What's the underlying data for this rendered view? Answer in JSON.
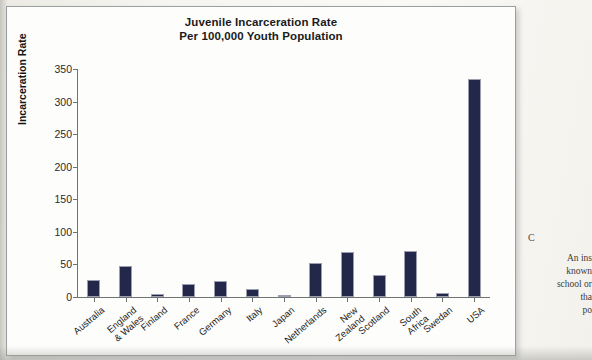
{
  "chart_data": {
    "type": "bar",
    "title": "Juvenile Incarceration Rate Per 100,000 Youth Population",
    "title_line1": "Juvenile Incarceration Rate",
    "title_line2": "Per 100,000 Youth Population",
    "xlabel": "",
    "ylabel": "Incarceration Rate",
    "ylim": [
      0,
      350
    ],
    "yticks": [
      0,
      50,
      100,
      150,
      200,
      250,
      300,
      350
    ],
    "grid": false,
    "legend": "none",
    "bar_color": "#232749",
    "categories": [
      "Australia",
      "England & Wales",
      "Finland",
      "France",
      "Germany",
      "Italy",
      "Japan",
      "Netherlands",
      "New Zealand",
      "Scotland",
      "South Africa",
      "Swedan",
      "USA"
    ],
    "category_lines": [
      [
        "Australia"
      ],
      [
        "England",
        "& Wales"
      ],
      [
        "Finland"
      ],
      [
        "France"
      ],
      [
        "Germany"
      ],
      [
        "Italy"
      ],
      [
        "Japan"
      ],
      [
        "Netherlands"
      ],
      [
        "New",
        "Zealand"
      ],
      [
        "Scotland"
      ],
      [
        "South",
        "Africa"
      ],
      [
        "Swedan"
      ],
      [
        "USA"
      ]
    ],
    "values": [
      26,
      48,
      4,
      20,
      24,
      13,
      1,
      52,
      69,
      34,
      70,
      6,
      335
    ]
  },
  "margin_text": {
    "lines": [
      "An ins",
      "known",
      "school or",
      "tha",
      "po"
    ],
    "mark": "C"
  }
}
